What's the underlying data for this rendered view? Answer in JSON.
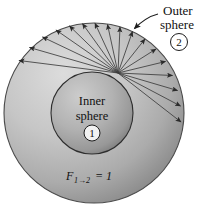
{
  "figure": {
    "background_color": "#ffffff",
    "stroke_color": "#3a3a3a"
  },
  "outer_sphere": {
    "label_line1": "Outer",
    "label_line2": "sphere",
    "badge": "2",
    "center_x": 94,
    "center_y": 113,
    "radius": 90,
    "fill_light": "#cfcfcf",
    "fill_dark": "#8f8f8f"
  },
  "inner_sphere": {
    "label_line1": "Inner",
    "label_line2": "sphere",
    "badge": "1",
    "center_x": 92,
    "center_y": 113,
    "radius": 41,
    "fill_light": "#bdbdbd",
    "fill_dark": "#7c7c7c"
  },
  "formula": {
    "symbol": "F",
    "subscript": "1→2",
    "equals": "= 1",
    "full_text": "F1→2 = 1"
  },
  "rays": {
    "origin_x": 118,
    "origin_y": 73,
    "count": 17,
    "description": "radiation rays from inner sphere surface point to outer sphere"
  },
  "leader": {
    "description": "pointer line from Outer sphere label to outer circle edge"
  }
}
